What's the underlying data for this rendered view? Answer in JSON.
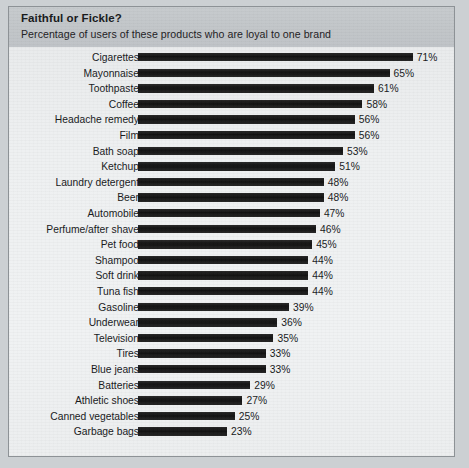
{
  "chart": {
    "title": "Faithful or Fickle?",
    "subtitle": "Percentage of users of these products who are loyal to one brand"
  },
  "chart_data": {
    "type": "bar",
    "orientation": "horizontal",
    "title": "Faithful or Fickle?",
    "subtitle": "Percentage of users of these products who are loyal to one brand",
    "xlabel": "",
    "ylabel": "",
    "xlim": [
      0,
      71
    ],
    "grid": false,
    "legend": false,
    "value_suffix": "%",
    "bar_color": "#1b1b1b",
    "background_color": "#eef0f1",
    "categories": [
      "Cigarettes",
      "Mayonnaise",
      "Toothpaste",
      "Coffee",
      "Headache remedy",
      "Film",
      "Bath soap",
      "Ketchup",
      "Laundry detergent",
      "Beer",
      "Automobile",
      "Perfume/after shave",
      "Pet food",
      "Shampoo",
      "Soft drink",
      "Tuna fish",
      "Gasoline",
      "Underwear",
      "Television",
      "Tires",
      "Blue jeans",
      "Batteries",
      "Athletic shoes",
      "Canned vegetables",
      "Garbage bags"
    ],
    "values": [
      71,
      65,
      61,
      58,
      56,
      56,
      53,
      51,
      48,
      48,
      47,
      46,
      45,
      44,
      44,
      44,
      39,
      36,
      35,
      33,
      33,
      29,
      27,
      25,
      23
    ],
    "value_labels": [
      "71%",
      "65%",
      "61%",
      "58%",
      "56%",
      "56%",
      "53%",
      "51%",
      "48%",
      "48%",
      "47%",
      "46%",
      "45%",
      "44%",
      "44%",
      "44%",
      "39%",
      "36%",
      "35%",
      "33%",
      "33%",
      "29%",
      "27%",
      "25%",
      "23%"
    ]
  }
}
